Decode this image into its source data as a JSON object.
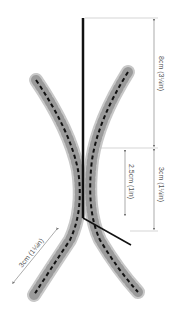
{
  "diagram": {
    "colors": {
      "bead_light": "#d9d9d9",
      "bead_mid": "#a8a8a8",
      "bead_dark": "#7a7a7a",
      "wire": "#111111",
      "dimension_line": "#888888",
      "label": "#555555"
    },
    "dimensions": [
      {
        "id": "top-length",
        "label": "8cm (3¼in)"
      },
      {
        "id": "twist-length",
        "label": "2.5cm (1in)"
      },
      {
        "id": "stem-length",
        "label": "3cm (1¼in)"
      },
      {
        "id": "leg-length",
        "label": "3cm (1¼in)"
      }
    ]
  }
}
